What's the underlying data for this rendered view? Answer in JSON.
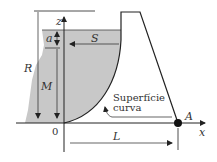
{
  "labels": {
    "z_axis": "z",
    "x_axis": "x",
    "origin": "0",
    "R": "R",
    "M": "M",
    "a": "a",
    "S": "S",
    "L": "L",
    "A": "A",
    "curve_label_line1": "Superfície",
    "curve_label_line2": "curva"
  },
  "colors": {
    "water_fill": "#c8c8c8",
    "line": "#222222"
  }
}
